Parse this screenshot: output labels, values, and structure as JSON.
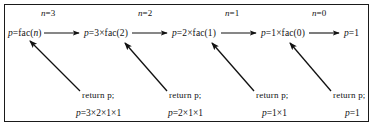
{
  "diagram": {
    "border_color": "#1a1a1a",
    "text_color": "#111111",
    "stack_labels": [
      {
        "text": "n=3",
        "x": 41,
        "y": 13
      },
      {
        "text": "n=2",
        "x": 138,
        "y": 13
      },
      {
        "text": "n=1",
        "x": 225,
        "y": 13
      },
      {
        "text": "n=0",
        "x": 312,
        "y": 13
      }
    ],
    "call_chain": [
      {
        "text": "p=fac(n)",
        "x": 8,
        "y": 29
      },
      {
        "text": "p=3×fac(2)",
        "x": 84,
        "y": 29
      },
      {
        "text": "p=2×fac(1)",
        "x": 172,
        "y": 29
      },
      {
        "text": "p=1×fac(0)",
        "x": 261,
        "y": 29
      },
      {
        "text": "p=1",
        "x": 344,
        "y": 29
      }
    ],
    "return_labels": [
      {
        "text": "return p;",
        "x": 82,
        "y": 91
      },
      {
        "text": "return p;",
        "x": 169,
        "y": 91
      },
      {
        "text": "return p;",
        "x": 256,
        "y": 91
      },
      {
        "text": "return p;",
        "x": 333,
        "y": 91
      }
    ],
    "results": [
      {
        "text": "p=3×2×1×1",
        "x": 76,
        "y": 109
      },
      {
        "text": "p=2×1×1",
        "x": 168,
        "y": 109
      },
      {
        "text": "p=1×1",
        "x": 262,
        "y": 109
      },
      {
        "text": "p=1",
        "x": 345,
        "y": 109
      }
    ],
    "forward_arrows": [
      {
        "x1": 44,
        "y1": 33,
        "x2": 81,
        "y2": 33
      },
      {
        "x1": 132,
        "y1": 33,
        "x2": 169,
        "y2": 33
      },
      {
        "x1": 221,
        "y1": 33,
        "x2": 258,
        "y2": 33
      },
      {
        "x1": 309,
        "y1": 33,
        "x2": 341,
        "y2": 33
      }
    ],
    "return_arrows": [
      {
        "x1": 80,
        "y1": 91,
        "x2": 29,
        "y2": 40
      },
      {
        "x1": 167,
        "y1": 91,
        "x2": 124,
        "y2": 42
      },
      {
        "x1": 254,
        "y1": 91,
        "x2": 211,
        "y2": 42
      },
      {
        "x1": 331,
        "y1": 91,
        "x2": 289,
        "y2": 42
      }
    ]
  }
}
